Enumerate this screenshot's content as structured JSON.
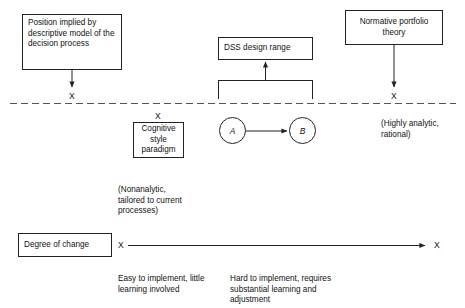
{
  "diagram": {
    "stroke_color": "#222222",
    "background": "#ffffff",
    "boxes": {
      "descriptive_model": {
        "text": "Position implied by descriptive model of the decision process"
      },
      "dss_design_range": {
        "text": "DSS design range"
      },
      "normative_theory": {
        "text": "Normative portfolio theory"
      },
      "cognitive_style": {
        "line1": "Cognitive",
        "line2": "style",
        "line3": "paradigm"
      },
      "degree_of_change": {
        "text": "Degree of change"
      }
    },
    "circles": {
      "a": "A",
      "b": "B"
    },
    "markers": {
      "x_left_top": "X",
      "x_cognitive": "X",
      "x_right_top": "X",
      "x_axis_left": "X",
      "x_axis_right": "X"
    },
    "captions": {
      "nonanalytic": "(Nonanalytic, tailored to current processes)",
      "highly_analytic": "(Highly analytic, rational)",
      "easy_to_implement": "Easy to implement, little learning involved",
      "hard_to_implement": "Hard to implement, requires substantial learning and adjustment"
    }
  }
}
